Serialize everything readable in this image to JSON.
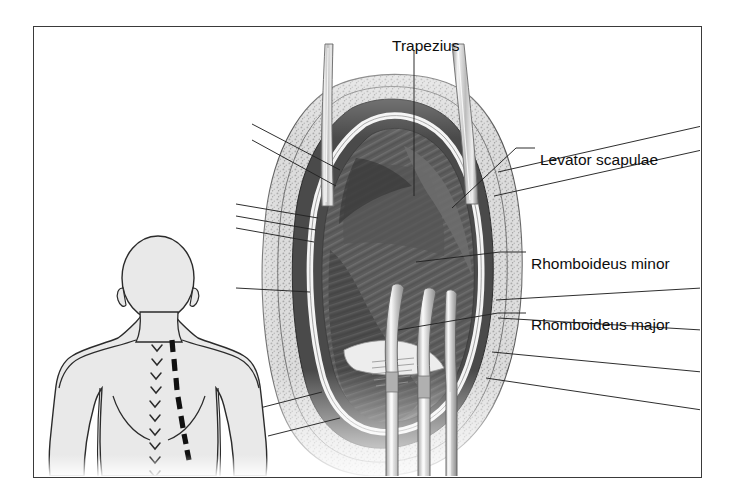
{
  "figure": {
    "type": "medical-illustration",
    "view": "posterior",
    "background_color": "#ffffff",
    "border_color": "#3a3a3a"
  },
  "labels": [
    {
      "id": "trapezius",
      "text": "Trapezius",
      "x": 392,
      "y": 38,
      "anchor": "start",
      "leader": "vertical-down"
    },
    {
      "id": "levator-scapulae",
      "text": "Levator scapulae",
      "x": 540,
      "y": 152,
      "anchor": "start",
      "leader": "horizontal-left"
    },
    {
      "id": "rhomboideus-minor",
      "text": "Rhomboideus minor",
      "x": 531,
      "y": 256,
      "anchor": "start",
      "leader": "horizontal-left"
    },
    {
      "id": "rhomboideus-major",
      "text": "Rhomboideus major",
      "x": 531,
      "y": 317,
      "anchor": "start",
      "leader": "horizontal-left"
    }
  ],
  "inset": {
    "id": "body-diagram",
    "name": "posterior-torso-silhouette",
    "fill": "#e9e9e9",
    "outline": "#2b2b2b",
    "incision": {
      "style": "dashed",
      "color": "#111111",
      "dashes": 9,
      "orientation": "paramedian-vertical"
    },
    "spinous_processes": {
      "marks": 10,
      "glyph": "chevron"
    }
  },
  "anatomy": {
    "layers": [
      {
        "id": "subcutaneous-fat",
        "texture": "stippled",
        "color": "#d8d8d8"
      },
      {
        "id": "trapezius-cut-edge",
        "texture": "solid",
        "color": "#4a4a4a"
      },
      {
        "id": "fascia-highlight",
        "texture": "solid",
        "color": "#f2f2f2"
      },
      {
        "id": "rhomboid-deep-muscle",
        "texture": "striated",
        "color": "#5e5e5e"
      }
    ],
    "instruments": [
      {
        "id": "retractor-blade-left",
        "type": "retractor"
      },
      {
        "id": "retractor-blade-right",
        "type": "retractor"
      },
      {
        "id": "hook-retractor-1",
        "type": "curved-hook"
      },
      {
        "id": "hook-retractor-2",
        "type": "curved-hook"
      },
      {
        "id": "hook-retractor-3",
        "type": "curved-hook"
      }
    ]
  }
}
